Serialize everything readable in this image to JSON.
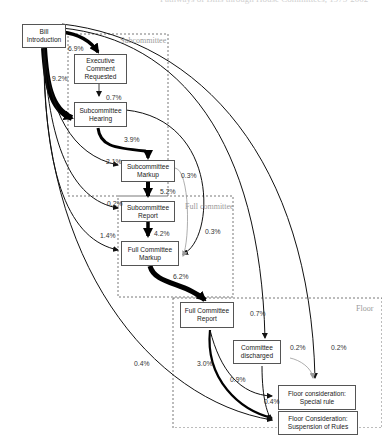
{
  "title": "Pathways of Bills through House Committees, 1975-2002",
  "regions": {
    "subcommittee": {
      "label": "Subcommittee"
    },
    "full_committee": {
      "label": "Full committee"
    },
    "floor": {
      "label": "Floor"
    }
  },
  "nodes": {
    "bill_introduction": {
      "line1": "Bill",
      "line2": "Introduction"
    },
    "executive_comment": {
      "line1": "Executive",
      "line2": "Comment",
      "line3": "Requested"
    },
    "subcommittee_hearing": {
      "line1": "Subcommittee",
      "line2": "Hearing"
    },
    "subcommittee_markup": {
      "line1": "Subcommittee",
      "line2": "Markup"
    },
    "subcommittee_report": {
      "line1": "Subcommittee",
      "line2": "Report"
    },
    "full_committee_markup": {
      "line1": "Full Committee",
      "line2": "Markup"
    },
    "full_committee_report": {
      "line1": "Full Committee",
      "line2": "Report"
    },
    "committee_discharged": {
      "line1": "Committee",
      "line2": "discharged"
    },
    "floor_special_rule": {
      "line1": "Floor consideration:",
      "line2": "Special rule"
    },
    "floor_suspension": {
      "line1": "Floor Consideration:",
      "line2": "Suspension of Rules"
    }
  },
  "edges": {
    "intro_to_exec": "6.9%",
    "intro_to_hearing": "9.2%",
    "exec_to_hearing": "0.7%",
    "hearing_to_markup": "3.9%",
    "intro_to_markup": "2.1%",
    "markup_to_fcmarkup_gray": "0.3%",
    "markup_to_report": "5.2%",
    "intro_to_report": "0.2%",
    "hearing_to_fcmarkup": "0.3%",
    "report_to_fcmarkup": "4.2%",
    "intro_to_fcmarkup": "1.4%",
    "fcmarkup_to_fcreport": "6.2%",
    "intro_to_discharged": "0.7%",
    "discharged_to_special": "0.2%",
    "intro_to_special": "0.2%",
    "intro_to_suspension": "0.4%",
    "fcreport_to_suspension": "3.0%",
    "fcreport_to_special": "0.9%",
    "discharged_to_suspension": "0.4%"
  }
}
